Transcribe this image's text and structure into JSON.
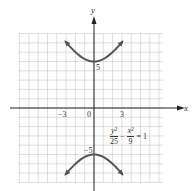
{
  "chart_data": {
    "type": "line",
    "title": "",
    "equation": "y^2/25 - x^2/9 = 1",
    "curve": "hyperbola",
    "xlabel": "x",
    "ylabel": "y",
    "xlim": [
      -8,
      7.5
    ],
    "ylim": [
      -8,
      8
    ],
    "grid": true,
    "x_ticks": [
      {
        "value": -3,
        "label": "−3"
      },
      {
        "value": 0,
        "label": "0"
      },
      {
        "value": 3,
        "label": "3"
      }
    ],
    "y_ticks": [
      {
        "value": 5,
        "label": "5"
      },
      {
        "value": -5,
        "label": "−5"
      }
    ],
    "vertices": [
      [
        0,
        5
      ],
      [
        0,
        -5
      ]
    ],
    "series": [
      {
        "name": "upper branch",
        "x_range": [
          -5,
          5
        ],
        "formula": "y = 5*sqrt(1 + x^2/9)"
      },
      {
        "name": "lower branch",
        "x_range": [
          -5,
          5
        ],
        "formula": "y = -5*sqrt(1 + x^2/9)"
      }
    ],
    "colors": {
      "curve": "#555555",
      "grid": "#c8c8c8",
      "axes": "#222222"
    }
  },
  "labels": {
    "x_axis": "x",
    "y_axis": "y",
    "tick_neg3": "−3",
    "tick_0": "0",
    "tick_3": "3",
    "tick_5": "5",
    "tick_neg5": "−5",
    "eq_num1": "y²",
    "eq_den1": "25",
    "eq_minus": "−",
    "eq_num2": "x²",
    "eq_den2": "9",
    "eq_rhs": "= 1"
  }
}
